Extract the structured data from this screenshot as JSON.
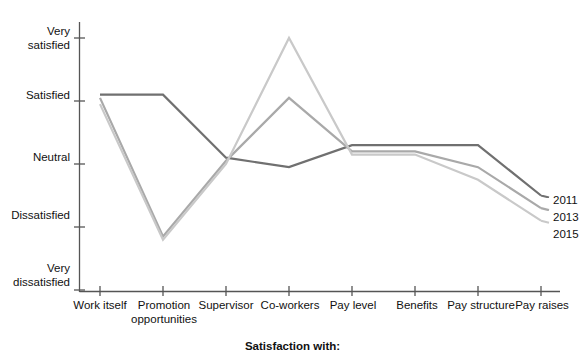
{
  "chart_data": {
    "type": "line",
    "title": "",
    "xlabel": "Satisfaction with:",
    "ylabel": "",
    "grid": false,
    "legend_position": "right-inline",
    "categories": [
      "Work itself",
      "Promotion opportunities",
      "Supervisor",
      "Co-workers",
      "Pay level",
      "Benefits",
      "Pay structure",
      "Pay raises"
    ],
    "ytick_labels": [
      "Very satisfied",
      "Satisfied",
      "Neutral",
      "Dissatisfied",
      "Very dissatisfied"
    ],
    "ytick_values": [
      5,
      4,
      3,
      2,
      1
    ],
    "ylim": [
      1,
      5
    ],
    "series": [
      {
        "name": "2011",
        "color": "#6f6f6f",
        "values": [
          4.1,
          4.1,
          3.1,
          2.95,
          3.3,
          3.3,
          3.3,
          2.5
        ]
      },
      {
        "name": "2013",
        "color": "#a9a9a9",
        "values": [
          4.05,
          1.85,
          3.05,
          4.05,
          3.2,
          3.2,
          2.95,
          2.3
        ]
      },
      {
        "name": "2015",
        "color": "#c9c9c9",
        "values": [
          3.95,
          1.8,
          3.0,
          5.0,
          3.15,
          3.15,
          2.75,
          2.1
        ]
      }
    ]
  },
  "legend": {
    "entries": [
      "2011",
      "2013",
      "2015"
    ]
  },
  "axes": {
    "x_title": "Satisfaction with:"
  }
}
